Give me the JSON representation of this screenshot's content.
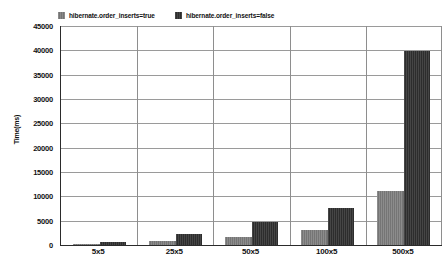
{
  "chart_data": {
    "type": "bar",
    "title": "",
    "xlabel": "",
    "ylabel": "Time(ms)",
    "ylim": [
      0,
      45000
    ],
    "ystep": 5000,
    "grid": true,
    "legend_position": "top-left",
    "categories": [
      "5x5",
      "25x5",
      "50x5",
      "100x5",
      "500x5"
    ],
    "yticks": [
      "45000",
      "40000",
      "35000",
      "30000",
      "25000",
      "20000",
      "15000",
      "10000",
      "5000",
      "0"
    ],
    "series": [
      {
        "name": "hibernate.order_inserts=true",
        "color": "#808080",
        "values": [
          250,
          900,
          1700,
          3000,
          11000
        ]
      },
      {
        "name": "hibernate.order_inserts=false",
        "color": "#3a3a3a",
        "values": [
          600,
          2300,
          4700,
          7700,
          39800
        ]
      }
    ]
  },
  "legend": {
    "items": [
      {
        "label": "hibernate.order_inserts=true"
      },
      {
        "label": "hibernate.order_inserts=false"
      }
    ]
  },
  "axes": {
    "y_title": "Time(ms)"
  },
  "caption": {
    "text": ""
  }
}
